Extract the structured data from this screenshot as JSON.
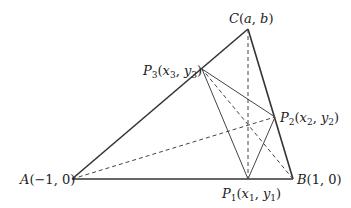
{
  "diagram": {
    "type": "geometry",
    "colors": {
      "stroke": "#333333",
      "text": "#222222",
      "background": "#ffffff"
    },
    "points": {
      "A": {
        "x": 72,
        "y": 179,
        "label": "A(−1, 0)"
      },
      "B": {
        "x": 293,
        "y": 179,
        "label": "B(1, 0)"
      },
      "C": {
        "x": 248,
        "y": 29,
        "label": "C(a, b)"
      },
      "P1": {
        "x": 248,
        "y": 179,
        "label": "P1(x1, y1)"
      },
      "P2": {
        "x": 275,
        "y": 117,
        "label": "P2(x2, y2)"
      },
      "P3": {
        "x": 202,
        "y": 69,
        "label": "P3(x3, y3)"
      }
    },
    "labels": {
      "A": {
        "name": "A",
        "coords": "(−1, 0)"
      },
      "B": {
        "name": "B",
        "coords": "(1, 0)"
      },
      "C": {
        "name": "C",
        "coords_open": "(",
        "a": "a",
        "comma": ", ",
        "b": "b",
        "coords_close": ")"
      },
      "P1": {
        "name": "P",
        "sub": "1",
        "open": "(",
        "x": "x",
        "xsub": "1",
        "comma": ", ",
        "y": "y",
        "ysub": "1",
        "close": ")"
      },
      "P2": {
        "name": "P",
        "sub": "2",
        "open": "(",
        "x": "x",
        "xsub": "2",
        "comma": ", ",
        "y": "y",
        "ysub": "2",
        "close": ")"
      },
      "P3": {
        "name": "P",
        "sub": "3",
        "open": "(",
        "x": "x",
        "xsub": "3",
        "comma": ", ",
        "y": "y",
        "ysub": "3",
        "close": ")"
      }
    },
    "segments": {
      "triangle": [
        "A-B",
        "B-C",
        "C-A"
      ],
      "orthic_triangle": [
        "P1-P2",
        "P2-P3",
        "P3-P1"
      ],
      "altitudes_dashed": [
        "C-P1",
        "A-P2",
        "B-P3"
      ]
    }
  }
}
